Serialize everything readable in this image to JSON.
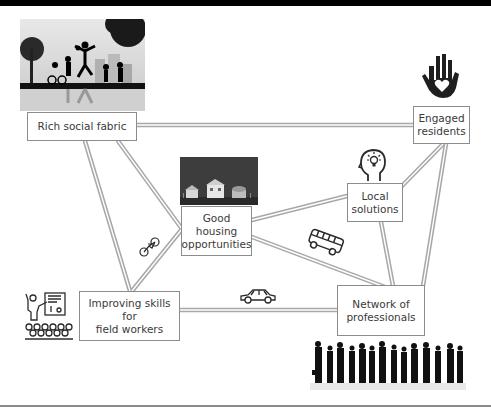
{
  "diagram": {
    "title": "",
    "nodes": [
      {
        "id": "rich-social-fabric",
        "label": "Rich social fabric",
        "image": "children-playing-park-photo"
      },
      {
        "id": "engaged-residents",
        "label": "Engaged residents",
        "icon": "hand-heart-icon"
      },
      {
        "id": "good-housing",
        "label": "Good housing opportunities",
        "image": "houses-night-photo"
      },
      {
        "id": "local-solutions",
        "label": "Local solutions",
        "icon": "head-lightbulb-icon"
      },
      {
        "id": "improving-skills",
        "label": "Improving skills for field workers",
        "icon": "teacher-audience-icon"
      },
      {
        "id": "network-professionals",
        "label": "Network of professionals",
        "image": "business-people-silhouettes"
      }
    ],
    "edges": [
      {
        "from": "rich-social-fabric",
        "to": "engaged-residents",
        "style": "double-grey-road"
      },
      {
        "from": "rich-social-fabric",
        "to": "good-housing",
        "style": "double-grey-road"
      },
      {
        "from": "rich-social-fabric",
        "to": "improving-skills",
        "style": "double-grey-road"
      },
      {
        "from": "good-housing",
        "to": "improving-skills",
        "style": "double-grey-road",
        "icon": "bicycle-icon"
      },
      {
        "from": "good-housing",
        "to": "local-solutions",
        "style": "double-grey-road"
      },
      {
        "from": "good-housing",
        "to": "network-professionals",
        "style": "double-grey-road",
        "icon": "bus-icon"
      },
      {
        "from": "improving-skills",
        "to": "network-professionals",
        "style": "double-grey-road",
        "icon": "car-icon"
      },
      {
        "from": "local-solutions",
        "to": "engaged-residents",
        "style": "double-grey-road"
      },
      {
        "from": "local-solutions",
        "to": "network-professionals",
        "style": "double-grey-road"
      },
      {
        "from": "engaged-residents",
        "to": "network-professionals",
        "style": "double-grey-road"
      }
    ]
  },
  "labels": {
    "rich_social_fabric": "Rich social fabric",
    "engaged_1": "Engaged",
    "engaged_2": "residents",
    "housing_1": "Good",
    "housing_2": "housing",
    "housing_3": "opportunities",
    "local_1": "Local",
    "local_2": "solutions",
    "skills_1": "Improving skills for",
    "skills_2": "field workers",
    "network_1": "Network of",
    "network_2": "professionals"
  },
  "colors": {
    "road": "#a8a8a8",
    "box_border": "#8c8c8c",
    "text": "#3a3a3a",
    "icon": "#2b2b2b"
  }
}
